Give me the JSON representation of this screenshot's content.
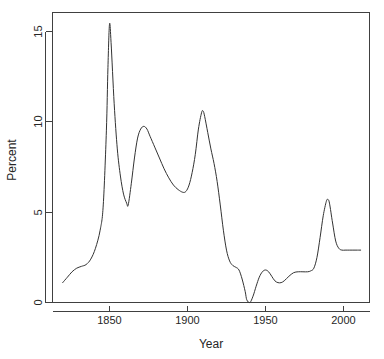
{
  "chart_data": {
    "type": "line",
    "title": "",
    "subtitle": "",
    "xlabel": "Year",
    "ylabel": "Percent",
    "xlim": [
      1820,
      2012
    ],
    "ylim": [
      -0.3,
      16.0
    ],
    "xticks": [
      1850,
      1900,
      1950,
      2000
    ],
    "yticks": [
      0,
      5,
      10,
      15
    ],
    "xtick_labels": [
      "1850",
      "1900",
      "1950",
      "2000"
    ],
    "ytick_labels": [
      "0",
      "5",
      "10",
      "15"
    ],
    "grid": false,
    "legend": false,
    "legend_position": "none",
    "line_color": "#333333",
    "series": [
      {
        "name": "Percent",
        "x": [
          1820,
          1823,
          1826,
          1829,
          1832,
          1835,
          1838,
          1841,
          1844,
          1846,
          1848,
          1849,
          1850,
          1851,
          1853,
          1855,
          1857,
          1859,
          1861,
          1862,
          1864,
          1866,
          1868,
          1870,
          1872,
          1874,
          1876,
          1879,
          1882,
          1885,
          1888,
          1891,
          1894,
          1897,
          1899,
          1901,
          1903,
          1905,
          1907,
          1909,
          1910,
          1911,
          1913,
          1915,
          1917,
          1919,
          1921,
          1923,
          1925,
          1927,
          1929,
          1931,
          1933,
          1935,
          1937,
          1938,
          1940,
          1942,
          1944,
          1946,
          1948,
          1950,
          1952,
          1954,
          1956,
          1958,
          1960,
          1962,
          1965,
          1968,
          1971,
          1974,
          1977,
          1979,
          1981,
          1983,
          1985,
          1987,
          1989,
          1990,
          1991,
          1993,
          1995,
          1997,
          1999,
          2001,
          2004,
          2008,
          2011
        ],
        "y": [
          1.1,
          1.4,
          1.7,
          1.9,
          2.0,
          2.1,
          2.4,
          3.0,
          4.0,
          5.4,
          9.5,
          13.0,
          15.4,
          14.4,
          11.0,
          8.5,
          7.0,
          6.0,
          5.5,
          5.4,
          6.6,
          8.0,
          9.1,
          9.6,
          9.75,
          9.6,
          9.2,
          8.6,
          8.0,
          7.4,
          6.9,
          6.5,
          6.25,
          6.1,
          6.15,
          6.5,
          7.2,
          8.2,
          9.6,
          10.5,
          10.6,
          10.3,
          9.4,
          8.5,
          7.7,
          6.7,
          5.4,
          4.0,
          2.9,
          2.3,
          2.05,
          1.95,
          1.8,
          1.3,
          0.6,
          0.15,
          0.0,
          0.35,
          0.9,
          1.4,
          1.7,
          1.8,
          1.7,
          1.45,
          1.2,
          1.1,
          1.1,
          1.2,
          1.45,
          1.65,
          1.7,
          1.7,
          1.7,
          1.75,
          1.9,
          2.5,
          3.6,
          4.8,
          5.6,
          5.7,
          5.5,
          4.4,
          3.4,
          3.0,
          2.9,
          2.9,
          2.9,
          2.9,
          2.9
        ]
      }
    ],
    "annotations": [],
    "key_points": {
      "peak_1850": 15.4,
      "trough_1862": 5.4,
      "peak_1872": 9.75,
      "trough_1898": 6.1,
      "peak_1910": 10.6,
      "minimum_1940": 0.0,
      "peak_1990": 5.7,
      "final_value": 2.9
    }
  },
  "axes": {
    "x_title": "Year",
    "y_title": "Percent"
  }
}
